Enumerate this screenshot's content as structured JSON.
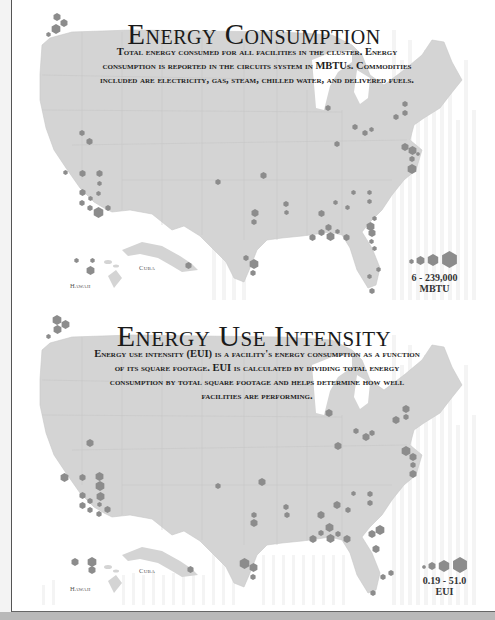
{
  "panels": [
    {
      "title": "Energy Consumption",
      "description": "Total energy consumed for all facilities in the cluster. Energy consumption is reported in the circuits system in MBTUs. Commodities included are electricity, gas, steam, chilled water, and delivered fuels.",
      "legend": {
        "range": "6 - 239,000",
        "unit": "MBTU"
      },
      "labels": {
        "hawaii": "Hawaii",
        "cuba": "Cuba"
      }
    },
    {
      "title": "Energy Use Intensity",
      "description": "Energy use intensity (EUI) is a facility's energy consumption as a function of its square footage. EUI is calculated by dividing total energy consumption by total square footage and helps determine how well facilities are performing.",
      "legend": {
        "range": "0.19 - 51.0",
        "unit": "EUI"
      },
      "labels": {
        "hawaii": "Hawaii",
        "cuba": "Cuba"
      }
    }
  ],
  "colors": {
    "land": "#d4d4d4",
    "marker": "#8c8c8c",
    "border": "#c4c4c4",
    "text": "#1a1a1a"
  }
}
